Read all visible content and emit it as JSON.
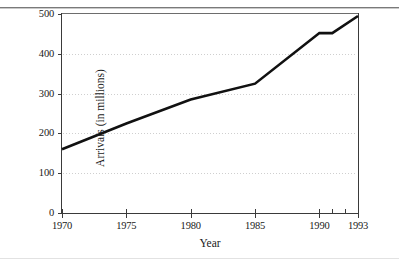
{
  "chart_data": {
    "type": "line",
    "title": "",
    "subtitle": "",
    "xlabel": "Year",
    "ylabel": "Arrivals (in millions)",
    "xlim": [
      1970,
      1993
    ],
    "ylim": [
      0,
      500
    ],
    "grid": true,
    "grid_axis": "y",
    "legend": false,
    "legend_position": "none",
    "x_tick_labels": [
      "1970",
      "1975",
      "1980",
      "1985",
      "1990",
      "1993"
    ],
    "x_tick_values": [
      1970,
      1975,
      1980,
      1985,
      1990,
      1993
    ],
    "x_minor_tick_values": [
      1991,
      1992
    ],
    "y_tick_labels": [
      "0",
      "100",
      "200",
      "300",
      "400",
      "500"
    ],
    "y_tick_values": [
      0,
      100,
      200,
      300,
      400,
      500
    ],
    "series": [
      {
        "name": "International tourist arrivals",
        "color": "#111111",
        "x": [
          1970,
          1975,
          1980,
          1985,
          1990,
          1991,
          1993
        ],
        "values": [
          160,
          225,
          285,
          325,
          452,
          452,
          495
        ]
      }
    ],
    "annotations": []
  },
  "axis_titles": {
    "x": "Year",
    "y": "Arrivals (in millions)"
  }
}
